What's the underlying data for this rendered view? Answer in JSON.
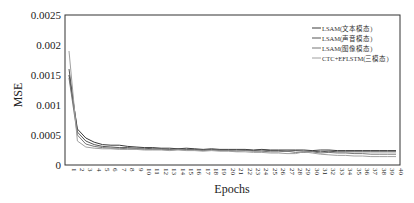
{
  "chart_data": {
    "type": "line",
    "title": "",
    "xlabel": "Epochs",
    "ylabel": "MSE",
    "ylim": [
      0,
      0.0025
    ],
    "yticks": [
      "0",
      "0.0005",
      "0.001",
      "0.0015",
      "0.002",
      "0.0025"
    ],
    "grid": false,
    "legend_position": "upper right",
    "x": [
      1,
      2,
      3,
      4,
      5,
      6,
      7,
      8,
      9,
      10,
      11,
      12,
      13,
      14,
      15,
      16,
      17,
      18,
      19,
      20,
      21,
      22,
      23,
      24,
      25,
      26,
      27,
      28,
      29,
      30,
      31,
      32,
      33,
      34,
      35,
      36,
      37,
      38,
      39,
      40
    ],
    "series": [
      {
        "name": "LSAM(文本模态)",
        "color": "#3a3a3a",
        "values": [
          0.0015,
          0.0006,
          0.00045,
          0.00038,
          0.00034,
          0.00033,
          0.00033,
          0.00031,
          0.0003,
          0.00029,
          0.00029,
          0.00028,
          0.00028,
          0.00027,
          0.00028,
          0.00027,
          0.00026,
          0.00027,
          0.00026,
          0.00026,
          0.00026,
          0.00026,
          0.00025,
          0.00026,
          0.00025,
          0.00025,
          0.00025,
          0.00025,
          0.00025,
          0.00024,
          0.00025,
          0.00025,
          0.00024,
          0.00024,
          0.00024,
          0.00024,
          0.00024,
          0.00024,
          0.00024,
          0.00024
        ]
      },
      {
        "name": "LSAM(声音模态)",
        "color": "#555555",
        "values": [
          0.0016,
          0.00055,
          0.0004,
          0.00034,
          0.00031,
          0.0003,
          0.00029,
          0.00029,
          0.00028,
          0.00028,
          0.00027,
          0.00027,
          0.00026,
          0.00027,
          0.00026,
          0.00026,
          0.00025,
          0.00026,
          0.00025,
          0.00025,
          0.00025,
          0.00025,
          0.00024,
          0.00025,
          0.00024,
          0.00024,
          0.00023,
          0.00024,
          0.00023,
          0.00023,
          0.00022,
          0.00023,
          0.00022,
          0.00022,
          0.00022,
          0.00022,
          0.00022,
          0.00022,
          0.00022,
          0.00022
        ]
      },
      {
        "name": "LSAM(图像模态)",
        "color": "#777777",
        "values": [
          0.00145,
          0.0005,
          0.00035,
          0.00031,
          0.00029,
          0.00028,
          0.00028,
          0.00027,
          0.00027,
          0.00026,
          0.00026,
          0.00026,
          0.00025,
          0.00026,
          0.00025,
          0.00025,
          0.00024,
          0.00025,
          0.00024,
          0.00024,
          0.00023,
          0.00024,
          0.00023,
          0.00023,
          0.00022,
          0.00022,
          0.00023,
          0.00021,
          0.00021,
          0.00022,
          0.0002,
          0.00021,
          0.0002,
          0.0002,
          0.00019,
          0.00019,
          0.00018,
          0.00018,
          0.00018,
          0.00018
        ]
      },
      {
        "name": "CTC+EFLSTM(三模态)",
        "color": "#a0a0a0",
        "values": [
          0.0019,
          0.0004,
          0.0003,
          0.00028,
          0.00027,
          0.00027,
          0.00026,
          0.00026,
          0.00026,
          0.00025,
          0.00025,
          0.00025,
          0.00024,
          0.00025,
          0.00024,
          0.00024,
          0.00023,
          0.00024,
          0.00023,
          0.00023,
          0.00022,
          0.00022,
          0.00021,
          0.00021,
          0.0002,
          0.0002,
          0.00019,
          0.00019,
          0.00022,
          0.0002,
          0.00018,
          0.00017,
          0.00016,
          0.00016,
          0.00015,
          0.00015,
          0.00014,
          0.00014,
          0.00014,
          0.00014
        ]
      }
    ]
  }
}
